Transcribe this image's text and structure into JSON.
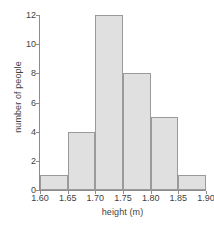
{
  "chart_data": {
    "type": "bar",
    "title": "",
    "subtitle": "",
    "xlabel": "height (m)",
    "ylabel": "number of people",
    "categories": [
      "1.60-1.65",
      "1.65-1.70",
      "1.70-1.75",
      "1.75-1.80",
      "1.80-1.85",
      "1.85-1.90"
    ],
    "bin_edges": [
      1.6,
      1.65,
      1.7,
      1.75,
      1.8,
      1.85,
      1.9
    ],
    "values": [
      1,
      4,
      12,
      8,
      5,
      1
    ],
    "bin_width": 0.05,
    "xlim": [
      1.6,
      1.9
    ],
    "ylim": [
      0,
      12
    ],
    "xticks": [
      "1.60",
      "1.65",
      "1.70",
      "1.75",
      "1.80",
      "1.85",
      "1.90"
    ],
    "xtick_values": [
      1.6,
      1.65,
      1.7,
      1.75,
      1.8,
      1.85,
      1.9
    ],
    "yticks": [
      "0",
      "2",
      "4",
      "6",
      "8",
      "10",
      "12"
    ],
    "ytick_values": [
      0,
      2,
      4,
      6,
      8,
      10,
      12
    ],
    "grid": false,
    "legend": null,
    "total_count": 31,
    "colors": {
      "bar_fill": "#e0e0e0",
      "bar_border": "#9a9a9a",
      "axis": "#8c8c8c",
      "text": "#3f3f3f",
      "background": "#ffffff"
    }
  }
}
